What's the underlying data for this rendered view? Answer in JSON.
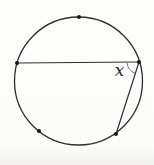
{
  "figure": {
    "width": 154,
    "height": 165,
    "background": "#fdfdfc",
    "stroke_color": "#2e2e2e",
    "point_color": "#161616",
    "angle_arc_color": "#6a6a6a",
    "circle": {
      "cx": 78.5,
      "cy": 81,
      "r": 64
    },
    "points": [
      {
        "name": "top-point",
        "x": 79,
        "y": 17
      },
      {
        "name": "left-chord-point",
        "x": 17,
        "y": 63
      },
      {
        "name": "vertex-point",
        "x": 139,
        "y": 62
      },
      {
        "name": "bottom-left-point",
        "x": 39,
        "y": 131
      },
      {
        "name": "bottom-right-point",
        "x": 116,
        "y": 134
      }
    ],
    "chords": [
      {
        "name": "long-chord",
        "from": "left-chord-point",
        "to": "vertex-point"
      },
      {
        "name": "short-chord",
        "from": "vertex-point",
        "to": "bottom-right-point"
      }
    ],
    "angle": {
      "vertex": "vertex-point",
      "rays_to": [
        "bottom-right-point",
        "left-chord-point"
      ],
      "arc_radius": 12,
      "label": "x",
      "label_x": 119.5,
      "label_y": 75.5
    }
  }
}
